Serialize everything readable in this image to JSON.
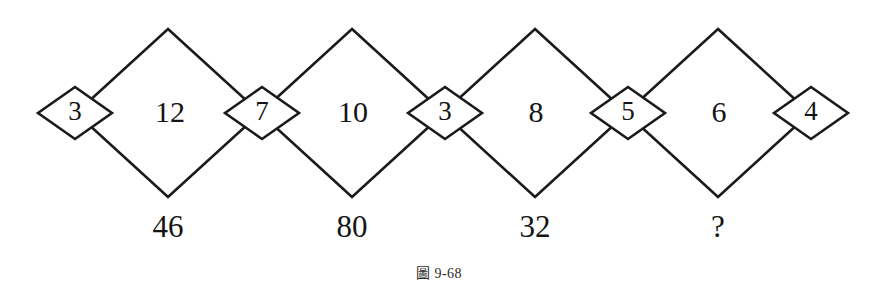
{
  "figure": {
    "caption_label": "圖",
    "caption_number": "9-68",
    "line_color": "#1a1a1a",
    "text_color": "#141414",
    "background": "#ffffff"
  },
  "diagram": {
    "type": "number-puzzle-diamond-chain",
    "large_diamonds": [
      {
        "value": "12",
        "cx": 168,
        "cy": 113
      },
      {
        "value": "10",
        "cx": 352,
        "cy": 113
      },
      {
        "value": "8",
        "cx": 535,
        "cy": 113
      },
      {
        "value": "6",
        "cx": 718,
        "cy": 113
      }
    ],
    "small_diamonds": [
      {
        "value": "3",
        "cx": 75,
        "cy": 113
      },
      {
        "value": "7",
        "cx": 262,
        "cy": 113
      },
      {
        "value": "3",
        "cx": 445,
        "cy": 113
      },
      {
        "value": "5",
        "cx": 628,
        "cy": 113
      },
      {
        "value": "4",
        "cx": 811,
        "cy": 113
      }
    ],
    "results": [
      {
        "value": "46",
        "cx": 168,
        "cy": 230
      },
      {
        "value": "80",
        "cx": 352,
        "cy": 230
      },
      {
        "value": "32",
        "cx": 535,
        "cy": 230
      },
      {
        "value": "?",
        "cx": 718,
        "cy": 230
      }
    ]
  }
}
